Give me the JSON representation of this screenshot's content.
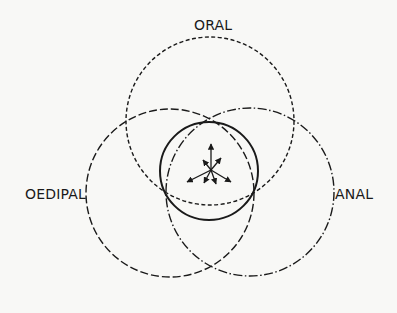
{
  "diagram": {
    "type": "overlapping-circles",
    "labels": {
      "oral": "ORAL",
      "oedipal": "OEDIPAL",
      "anal": "ANAL"
    },
    "colors": {
      "background": "#f8f8f6",
      "stroke": "#1a1a1a"
    },
    "circles": [
      {
        "name": "oral",
        "cx": 210,
        "cy": 121,
        "r": 84,
        "style": "short-dash"
      },
      {
        "name": "oedipal",
        "cx": 170,
        "cy": 193,
        "r": 84,
        "style": "long-dash"
      },
      {
        "name": "anal",
        "cx": 250,
        "cy": 192,
        "r": 84,
        "style": "dash-dot"
      },
      {
        "name": "center",
        "cx": 209,
        "cy": 171,
        "r": 49,
        "style": "solid"
      }
    ],
    "arrows": {
      "origin": [
        211,
        170
      ],
      "tips": [
        [
          211,
          144
        ],
        [
          203,
          160
        ],
        [
          221,
          158
        ],
        [
          187,
          182
        ],
        [
          204,
          183
        ],
        [
          216,
          184
        ],
        [
          231,
          182
        ]
      ]
    }
  }
}
